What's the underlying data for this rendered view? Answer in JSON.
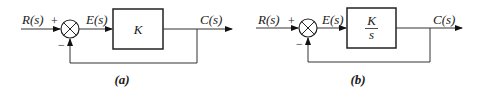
{
  "diagrams": [
    {
      "id": "a",
      "caption": "(a)",
      "input_label": "R(s)",
      "error_label": "E(s)",
      "output_label": "C(s)",
      "plus_sign": "+",
      "minus_sign": "−",
      "block": {
        "type": "gain",
        "numerator": "K",
        "denominator": ""
      }
    },
    {
      "id": "b",
      "caption": "(b)",
      "input_label": "R(s)",
      "error_label": "E(s)",
      "output_label": "C(s)",
      "plus_sign": "+",
      "minus_sign": "−",
      "block": {
        "type": "fraction",
        "numerator": "K",
        "denominator": "s"
      }
    }
  ]
}
